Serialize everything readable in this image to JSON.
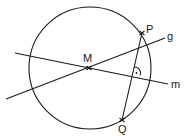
{
  "diagram": {
    "points": {
      "M": "M",
      "P": "P",
      "Q": "Q"
    },
    "lines": {
      "g": "g",
      "m": "m"
    },
    "annotations": {
      "right_angle": "·"
    },
    "stroke_color": "#1a1a1a",
    "background_color": "#ffffff"
  }
}
